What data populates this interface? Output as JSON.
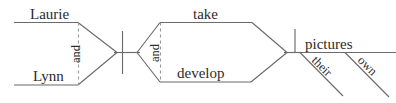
{
  "diagram": {
    "type": "reed-kellogg-sentence-diagram",
    "sentence": "Laurie and Lynn take and develop their own pictures.",
    "colors": {
      "background": "#ffffff",
      "line": "#6b6b6b",
      "dashed_line": "#9a9a9a",
      "text": "#2b2b2b"
    },
    "subject": {
      "label": "compound-subject",
      "nouns": [
        {
          "text": "Laurie",
          "position": "upper"
        },
        {
          "text": "Lynn",
          "position": "lower"
        }
      ],
      "conjunction": "and"
    },
    "predicate": {
      "label": "compound-verb",
      "verbs": [
        {
          "text": "take",
          "position": "upper"
        },
        {
          "text": "develop",
          "position": "lower"
        }
      ],
      "conjunction": "and"
    },
    "object": {
      "label": "direct-object",
      "text": "pictures",
      "modifiers": [
        {
          "text": "their",
          "type": "possessive-adjective"
        },
        {
          "text": "own",
          "type": "adjective"
        }
      ]
    },
    "dividers": {
      "subject_verb": "vertical-bar-crossing-baseline",
      "verb_object": "vertical-bar-above-baseline"
    }
  }
}
